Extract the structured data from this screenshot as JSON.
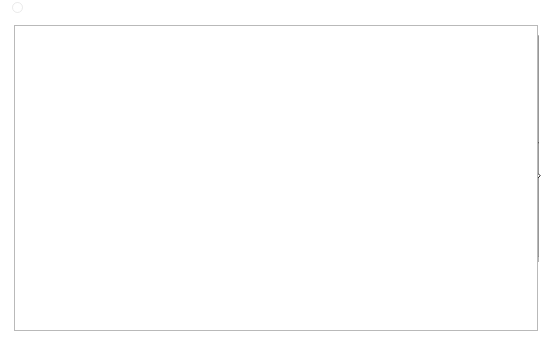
{
  "chart_data": {
    "type": "line",
    "title": "",
    "subtitle": "",
    "xlabel": "",
    "ylabel": "",
    "ylim": [
      0,
      20000
    ],
    "y_ticks": [
      0,
      5000,
      10000,
      15000,
      20000
    ],
    "y_tick_labels": [
      "0",
      "5000",
      "10000",
      "15000",
      "20000"
    ],
    "grid": "horizontal",
    "legend_position": "bottom",
    "x_tick_labels": [
      "1982",
      "1983",
      "1985",
      "1986",
      "1988",
      "1989",
      "1991",
      "1992",
      "1994",
      "1995",
      "1997",
      "1998",
      "2000",
      "2001"
    ],
    "x_tick_label_rotation": -45,
    "x_note": "quarterly observations; labels shown every 6th quarter",
    "n_points": 81,
    "series": [
      {
        "name": "user cost",
        "style": "dashed",
        "marker": "none",
        "color": "#000000",
        "values": [
          3600,
          2300,
          900,
          300,
          1200,
          2300,
          900,
          1800,
          3200,
          5200,
          6800,
          7600,
          8600,
          9700,
          11200,
          10400,
          9300,
          8700,
          7700,
          7500,
          8100,
          9000,
          9800,
          9500,
          8100,
          6200,
          5900,
          4900,
          5100,
          5600,
          5900,
          5800,
          5500,
          5500,
          5300,
          5400,
          5600,
          5700,
          5500,
          5200,
          5400,
          5500,
          5700,
          6000,
          6100,
          6400,
          6200,
          6100,
          6300,
          6200,
          6100,
          6300,
          6500,
          6700,
          6600,
          6400,
          6300,
          6100,
          5900,
          5700,
          5500,
          5400,
          5200,
          4800,
          4700,
          4800,
          4900,
          5000,
          5200,
          5400,
          5600,
          5800,
          6000,
          6200,
          6400,
          6500,
          6600,
          6800,
          6900,
          7100,
          7300
        ]
      },
      {
        "name": "predicted gross rent",
        "style": "solid",
        "marker": "none",
        "color": "#000000",
        "values": [
          5800,
          5500,
          5200,
          4700,
          5200,
          5400,
          5600,
          5800,
          6200,
          6100,
          6300,
          6100,
          6400,
          6600,
          6700,
          6600,
          6500,
          6400,
          6500,
          6600,
          6400,
          6300,
          6200,
          6000,
          5600,
          5300,
          5800,
          6100,
          6000,
          5700,
          5400,
          5800,
          6100,
          6400,
          6700,
          7100,
          7000,
          6800,
          6400,
          6200,
          6500,
          6800,
          7100,
          7400,
          7700,
          7500,
          7300,
          7600,
          7900,
          7800,
          7400,
          7100,
          6900,
          7400,
          7800,
          8200,
          8500,
          8300,
          8100,
          8200,
          8400,
          8700,
          8600,
          8400,
          8700,
          8900,
          8800,
          8900,
          9000,
          9100,
          9200,
          9300,
          9400,
          9500,
          9400,
          9300,
          9200,
          9500,
          9800,
          10000,
          10300
        ]
      },
      {
        "name": "predicted net rent",
        "style": "solid",
        "marker": "diamond",
        "color": "#000000",
        "values": [
          3600,
          3200,
          2900,
          3100,
          3300,
          3500,
          3600,
          3600,
          3800,
          3900,
          4100,
          4000,
          3900,
          3900,
          3900,
          3900,
          3800,
          3800,
          3700,
          3500,
          3300,
          3500,
          3800,
          4000,
          3800,
          3600,
          3800,
          4000,
          4200,
          4300,
          4400,
          4200,
          4000,
          4400,
          4600,
          4800,
          4700,
          4600,
          4400,
          4500,
          4700,
          4900,
          5100,
          5000,
          4900,
          5000,
          5200,
          5300,
          5200,
          5000,
          4800,
          4700,
          4900,
          5100,
          5400,
          5600,
          5800,
          5900,
          5700,
          5600,
          5700,
          5800,
          5900,
          6000,
          6100,
          6200,
          6100,
          6000,
          6200,
          6300,
          6400,
          6400,
          6300,
          6300,
          6200,
          6300,
          6500,
          6700,
          6900,
          7100,
          7300
        ]
      }
    ]
  },
  "legend": {
    "items": [
      {
        "label": "user cost",
        "style": "dashed",
        "marker": "none"
      },
      {
        "label": "predicted gross rent",
        "style": "solid",
        "marker": "none"
      },
      {
        "label": "predicted net rent",
        "style": "solid",
        "marker": "diamond"
      }
    ]
  },
  "colors": {
    "line": "#000000",
    "grid": "#b0b0b0",
    "axis": "#595959",
    "frame": "#b9b9b9",
    "text": "#1a1a1a",
    "background": "#ffffff"
  }
}
